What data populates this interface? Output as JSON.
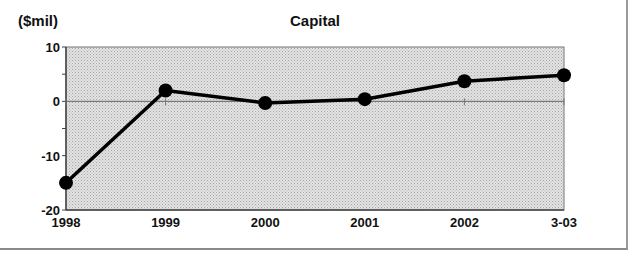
{
  "chart_data": {
    "type": "line",
    "title": "Capital",
    "ylabel": "($mil)",
    "xlabel": "",
    "categories": [
      "1998",
      "1999",
      "2000",
      "2001",
      "2002",
      "3-03"
    ],
    "values": [
      -15,
      2,
      -0.3,
      0.4,
      3.7,
      4.8
    ],
    "ylim": [
      -20,
      10
    ],
    "yticks": [
      10,
      0,
      -10,
      -20
    ],
    "grid": false,
    "zero_line": true,
    "legend": null,
    "colors": {
      "line": "#000000",
      "plot_bg": "#d9d9d9",
      "axis": "#555555"
    }
  }
}
